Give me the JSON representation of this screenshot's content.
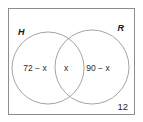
{
  "diagram": {
    "type": "venn",
    "title": "",
    "universe": {
      "label": "",
      "outside_count": "12"
    },
    "sets": [
      {
        "key": "H",
        "label": "H",
        "only_region_text": "72 − x"
      },
      {
        "key": "R",
        "label": "R",
        "only_region_text": "90 − x"
      }
    ],
    "regions": {
      "h_only": "72 − x",
      "intersection": "x",
      "r_only": "90 − x",
      "outside": "12"
    },
    "colors": {
      "background": "#ffffff",
      "rect_stroke": "#8c8c8c",
      "circle_stroke": "#9a9a9a",
      "text": "#2b2b2b",
      "label_text": "#1a1a1a"
    }
  }
}
